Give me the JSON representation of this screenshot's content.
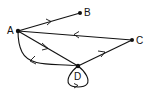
{
  "diagram": {
    "type": "directed-graph",
    "nodes": [
      {
        "id": "A",
        "label": "A",
        "x": 18,
        "y": 31
      },
      {
        "id": "B",
        "label": "B",
        "x": 80,
        "y": 13
      },
      {
        "id": "C",
        "label": "C",
        "x": 132,
        "y": 40
      },
      {
        "id": "D",
        "label": "D",
        "x": 78,
        "y": 66
      }
    ],
    "edges": [
      {
        "from": "A",
        "to": "B",
        "style": "straight"
      },
      {
        "from": "C",
        "to": "A",
        "style": "straight"
      },
      {
        "from": "A",
        "to": "D",
        "style": "straight"
      },
      {
        "from": "D",
        "to": "A",
        "style": "curved"
      },
      {
        "from": "D",
        "to": "C",
        "style": "straight"
      },
      {
        "from": "D",
        "to": "D",
        "style": "self-loop"
      }
    ]
  },
  "colors": {
    "ink": "#111111",
    "background": "#ffffff"
  }
}
